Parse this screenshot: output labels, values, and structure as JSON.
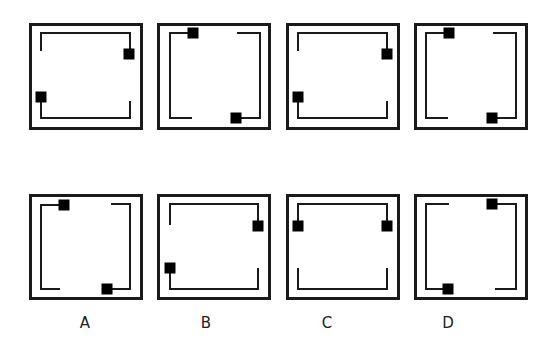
{
  "diagram": {
    "colors": {
      "stroke": "#1a1a1a",
      "marker": "#000000",
      "background": "#ffffff"
    },
    "question_row": [
      {
        "id": "q1",
        "box": [
          29,
          23,
          114,
          107
        ],
        "paths": [
          [
            [
              41,
              51
            ],
            [
              41,
              33
            ],
            [
              130,
              33
            ],
            [
              130,
              54
            ]
          ],
          [
            [
              41,
              97
            ],
            [
              41,
              118
            ],
            [
              130,
              118
            ],
            [
              130,
              101
            ]
          ]
        ],
        "markers": [
          [
            129,
            54
          ],
          [
            41,
            97
          ]
        ]
      },
      {
        "id": "q2",
        "box": [
          157,
          23,
          114,
          107
        ],
        "paths": [
          [
            [
              193,
              33
            ],
            [
              170,
              33
            ],
            [
              170,
              118
            ],
            [
              192,
              118
            ]
          ],
          [
            [
              237,
              33
            ],
            [
              260,
              33
            ],
            [
              260,
              118
            ],
            [
              236,
              118
            ]
          ]
        ],
        "markers": [
          [
            193,
            33
          ],
          [
            236,
            118
          ]
        ]
      },
      {
        "id": "q3",
        "box": [
          286,
          23,
          114,
          107
        ],
        "paths": [
          [
            [
              298,
              51
            ],
            [
              298,
              33
            ],
            [
              387,
              33
            ],
            [
              387,
              54
            ]
          ],
          [
            [
              298,
              97
            ],
            [
              298,
              118
            ],
            [
              387,
              118
            ],
            [
              387,
              101
            ]
          ]
        ],
        "markers": [
          [
            387,
            54
          ],
          [
            298,
            97
          ]
        ]
      },
      {
        "id": "q4",
        "box": [
          414,
          23,
          114,
          107
        ],
        "paths": [
          [
            [
              449,
              33
            ],
            [
              426,
              33
            ],
            [
              426,
              118
            ],
            [
              448,
              118
            ]
          ],
          [
            [
              493,
              33
            ],
            [
              516,
              33
            ],
            [
              516,
              118
            ],
            [
              492,
              118
            ]
          ]
        ],
        "markers": [
          [
            449,
            33
          ],
          [
            492,
            118
          ]
        ]
      }
    ],
    "options": [
      {
        "label": "A",
        "label_x": 85,
        "box": [
          29,
          194,
          114,
          106
        ],
        "paths": [
          [
            [
              64,
              205
            ],
            [
              41,
              205
            ],
            [
              41,
              289
            ],
            [
              60,
              289
            ]
          ],
          [
            [
              111,
              204
            ],
            [
              130,
              204
            ],
            [
              130,
              289
            ],
            [
              107,
              289
            ]
          ]
        ],
        "markers": [
          [
            64,
            205
          ],
          [
            107,
            289
          ]
        ]
      },
      {
        "label": "B",
        "label_x": 206,
        "box": [
          157,
          194,
          114,
          106
        ],
        "paths": [
          [
            [
              170,
              225
            ],
            [
              170,
              204
            ],
            [
              258,
              204
            ],
            [
              258,
              226
            ]
          ],
          [
            [
              170,
              268
            ],
            [
              170,
              289
            ],
            [
              258,
              289
            ],
            [
              258,
              268
            ]
          ]
        ],
        "markers": [
          [
            258,
            226
          ],
          [
            170,
            268
          ]
        ]
      },
      {
        "label": "C",
        "label_x": 327,
        "box": [
          286,
          194,
          114,
          106
        ],
        "paths": [
          [
            [
              298,
              226
            ],
            [
              298,
              204
            ],
            [
              387,
              204
            ],
            [
              387,
              226
            ]
          ],
          [
            [
              298,
              268
            ],
            [
              298,
              289
            ],
            [
              387,
              289
            ],
            [
              387,
              268
            ]
          ]
        ],
        "markers": [
          [
            298,
            226
          ],
          [
            387,
            226
          ]
        ]
      },
      {
        "label": "D",
        "label_x": 448,
        "box": [
          414,
          194,
          114,
          106
        ],
        "paths": [
          [
            [
              449,
              204
            ],
            [
              426,
              204
            ],
            [
              426,
              289
            ],
            [
              448,
              289
            ]
          ],
          [
            [
              492,
              204
            ],
            [
              516,
              204
            ],
            [
              516,
              289
            ],
            [
              495,
              289
            ]
          ]
        ],
        "markers": [
          [
            492,
            204
          ],
          [
            448,
            289
          ]
        ]
      }
    ]
  }
}
